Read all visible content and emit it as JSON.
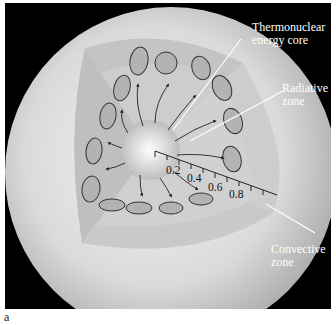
{
  "figure": {
    "panel_label": "a",
    "background_color": "#000000",
    "sphere_color": "#d8d8d8"
  },
  "labels": {
    "core": "Thermonuclear energy core",
    "core_line1": "Thermonuclear",
    "core_line2": "energy core",
    "radiative_line1": "Radiative",
    "radiative_line2": "zone",
    "convective_line1": "Convective",
    "convective_line2": "zone"
  },
  "scale": {
    "ticks": [
      "0.2",
      "0.4",
      "0.6",
      "0.8"
    ]
  }
}
